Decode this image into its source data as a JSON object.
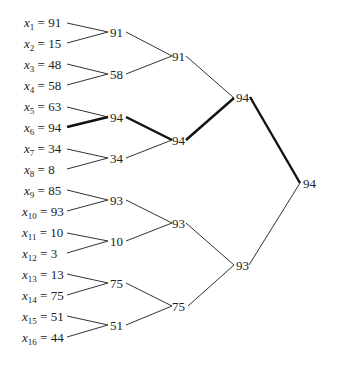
{
  "diagram": {
    "type": "tournament-tree",
    "leaves": [
      {
        "var": "x",
        "index": "1",
        "value": "91"
      },
      {
        "var": "x",
        "index": "2",
        "value": "15"
      },
      {
        "var": "x",
        "index": "3",
        "value": "48"
      },
      {
        "var": "x",
        "index": "4",
        "value": "58"
      },
      {
        "var": "x",
        "index": "5",
        "value": "63"
      },
      {
        "var": "x",
        "index": "6",
        "value": "94"
      },
      {
        "var": "x",
        "index": "7",
        "value": "34"
      },
      {
        "var": "x",
        "index": "8",
        "value": "8"
      },
      {
        "var": "x",
        "index": "9",
        "value": "85"
      },
      {
        "var": "x",
        "index": "10",
        "value": "93"
      },
      {
        "var": "x",
        "index": "11",
        "value": "10"
      },
      {
        "var": "x",
        "index": "12",
        "value": "3"
      },
      {
        "var": "x",
        "index": "13",
        "value": "13"
      },
      {
        "var": "x",
        "index": "14",
        "value": "75"
      },
      {
        "var": "x",
        "index": "15",
        "value": "51"
      },
      {
        "var": "x",
        "index": "16",
        "value": "44"
      }
    ],
    "level1": [
      "91",
      "58",
      "94",
      "34",
      "93",
      "10",
      "75",
      "51"
    ],
    "level2": [
      "91",
      "94",
      "93",
      "75"
    ],
    "level3": [
      "94",
      "93"
    ],
    "root": "94",
    "highlight_path": [
      "x6",
      "94",
      "94",
      "94",
      "94"
    ]
  }
}
